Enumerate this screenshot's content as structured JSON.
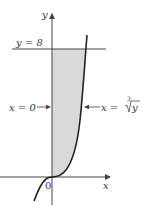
{
  "figure": {
    "type": "region-between-curves",
    "colors": {
      "shade": "#d9d9d9",
      "curve": "#222222",
      "axis": "#444444",
      "text": "#333333"
    },
    "axes": {
      "x_label": "x",
      "y_label": "y",
      "origin_label": "0"
    },
    "labels": {
      "top_line": "y = 8",
      "left_boundary": "x = 0",
      "right_boundary_prefix": "x = ",
      "right_boundary_index": "3",
      "right_boundary_radicand": "y"
    },
    "curve": "x = cbrt(y)",
    "bounds": {
      "y_min": 0,
      "y_max": 8,
      "x_left": 0
    }
  }
}
